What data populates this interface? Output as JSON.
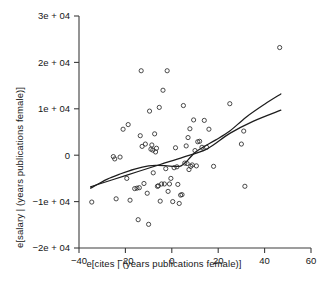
{
  "chart_data": {
    "type": "scatter",
    "title": "",
    "xlabel": "e[cites | (years publications female)]",
    "ylabel": "e[salary | (years publications female)]",
    "xlim": [
      -40,
      60
    ],
    "ylim": [
      -20000,
      30000
    ],
    "xticks": [
      -40,
      -20,
      0,
      20,
      40,
      60
    ],
    "xtick_labels": [
      "−40",
      "−20",
      "0",
      "20",
      "40",
      "60"
    ],
    "yticks": [
      -20000,
      -10000,
      0,
      10000,
      20000,
      30000
    ],
    "ytick_labels": [
      "−2e + 04",
      "−1e + 04",
      "0",
      "1e + 04",
      "2e + 04",
      "3e + 04"
    ],
    "grid": false,
    "legend": null,
    "marker": "open-circle",
    "marker_color": "#2b2b2b",
    "points": [
      [
        -34.5,
        -10100
      ],
      [
        -25.2,
        -300
      ],
      [
        -24.6,
        -800
      ],
      [
        -24.0,
        -9400
      ],
      [
        -22.3,
        -400
      ],
      [
        -21.0,
        5600
      ],
      [
        -19.4,
        -5000
      ],
      [
        -18.8,
        6600
      ],
      [
        -18.0,
        -9700
      ],
      [
        -16.0,
        -7200
      ],
      [
        -15.0,
        -7100
      ],
      [
        -14.5,
        -13900
      ],
      [
        -14.0,
        -7000
      ],
      [
        -13.6,
        4200
      ],
      [
        -13.2,
        18200
      ],
      [
        -12.8,
        1900
      ],
      [
        -12.0,
        -6100
      ],
      [
        -11.4,
        2400
      ],
      [
        -10.6,
        -8200
      ],
      [
        -10.0,
        -14900
      ],
      [
        -9.6,
        9500
      ],
      [
        -9.0,
        1300
      ],
      [
        -8.6,
        2200
      ],
      [
        -8.2,
        1100
      ],
      [
        -8.0,
        -3800
      ],
      [
        -7.4,
        4600
      ],
      [
        -7.0,
        700
      ],
      [
        -6.6,
        1500
      ],
      [
        -6.2,
        -6700
      ],
      [
        -5.8,
        -6600
      ],
      [
        -5.4,
        10300
      ],
      [
        -5.0,
        -9900
      ],
      [
        -4.4,
        -6200
      ],
      [
        -3.8,
        14000
      ],
      [
        -3.2,
        -6200
      ],
      [
        -2.6,
        -2900
      ],
      [
        -2.0,
        18200
      ],
      [
        -1.6,
        -7800
      ],
      [
        -1.0,
        -6200
      ],
      [
        -0.4,
        -5000
      ],
      [
        0.4,
        -10000
      ],
      [
        1.0,
        -2700
      ],
      [
        1.6,
        1600
      ],
      [
        2.2,
        -2500
      ],
      [
        2.6,
        -6300
      ],
      [
        3.2,
        -10400
      ],
      [
        3.8,
        -8600
      ],
      [
        4.4,
        -8500
      ],
      [
        5.0,
        10700
      ],
      [
        5.6,
        -1700
      ],
      [
        6.2,
        2000
      ],
      [
        6.6,
        -1800
      ],
      [
        7.0,
        3800
      ],
      [
        7.4,
        -3100
      ],
      [
        7.8,
        5700
      ],
      [
        8.2,
        -2400
      ],
      [
        8.8,
        -2100
      ],
      [
        9.4,
        7600
      ],
      [
        10.0,
        1000
      ],
      [
        10.6,
        -2300
      ],
      [
        11.2,
        2900
      ],
      [
        12.0,
        3000
      ],
      [
        13.0,
        1700
      ],
      [
        14.0,
        7500
      ],
      [
        15.0,
        1700
      ],
      [
        16.0,
        5600
      ],
      [
        18.0,
        -2400
      ],
      [
        25.0,
        11100
      ],
      [
        30.0,
        2400
      ],
      [
        31.0,
        5200
      ],
      [
        31.5,
        -6700
      ],
      [
        46.5,
        23200
      ]
    ],
    "fits": [
      {
        "name": "linear-fit",
        "path": [
          [
            -35.0,
            -6800
          ],
          [
            -20.0,
            -4400
          ],
          [
            -5.0,
            -2000
          ],
          [
            5.0,
            -400
          ],
          [
            15.0,
            1300
          ],
          [
            25.0,
            4700
          ],
          [
            35.0,
            7300
          ],
          [
            47.0,
            9700
          ]
        ]
      },
      {
        "name": "lowess-fit",
        "path": [
          [
            -35.0,
            -7100
          ],
          [
            -28.0,
            -5200
          ],
          [
            -22.0,
            -4000
          ],
          [
            -16.0,
            -3000
          ],
          [
            -10.0,
            -2300
          ],
          [
            -6.0,
            -2200
          ],
          [
            -2.0,
            -2300
          ],
          [
            1.0,
            -2400
          ],
          [
            4.0,
            -2300
          ],
          [
            7.0,
            -1000
          ],
          [
            10.0,
            600
          ],
          [
            14.0,
            1900
          ],
          [
            19.0,
            3300
          ],
          [
            25.0,
            5200
          ],
          [
            32.0,
            8200
          ],
          [
            40.0,
            11000
          ],
          [
            47.0,
            13200
          ]
        ]
      }
    ]
  }
}
